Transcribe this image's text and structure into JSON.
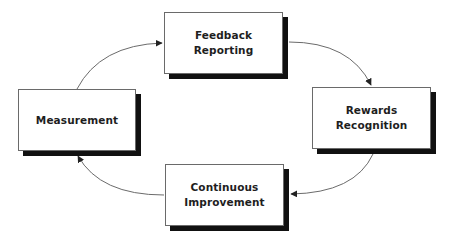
{
  "diagram": {
    "type": "cycle",
    "nodes": [
      {
        "id": "feedback",
        "label": "Feedback\nReporting"
      },
      {
        "id": "rewards",
        "label": "Rewards\nRecognition"
      },
      {
        "id": "continuous",
        "label": "Continuous\nImprovement"
      },
      {
        "id": "measurement",
        "label": "Measurement"
      }
    ],
    "edges": [
      {
        "from": "measurement",
        "to": "feedback"
      },
      {
        "from": "feedback",
        "to": "rewards"
      },
      {
        "from": "rewards",
        "to": "continuous"
      },
      {
        "from": "continuous",
        "to": "measurement"
      }
    ],
    "colors": {
      "box_fill": "#ffffff",
      "box_border": "#6a6a6a",
      "box_shadow": "#111111",
      "text": "#1e1e1e",
      "arrow": "#6b6b6b",
      "arrowhead": "#222222"
    }
  }
}
